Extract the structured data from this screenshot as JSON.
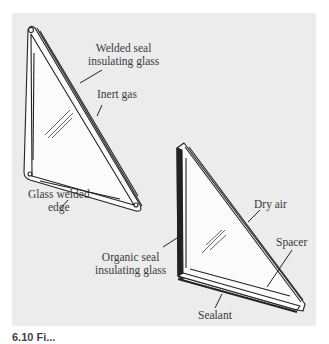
{
  "figure": {
    "panel_color": "#ececec",
    "line_color": "#222222",
    "label_color": "#3a3a3a"
  },
  "labels": {
    "welded_seal": [
      "Welded seal",
      "insulating glass"
    ],
    "inert_gas": "Inert gas",
    "glass_welded_edge": [
      "Glass welded",
      "edge"
    ],
    "dry_air": "Dry air",
    "spacer": "Spacer",
    "organic_seal": [
      "Organic seal",
      "insulating glass"
    ],
    "sealant": "Sealant"
  },
  "caption": "6.10 Fi..."
}
